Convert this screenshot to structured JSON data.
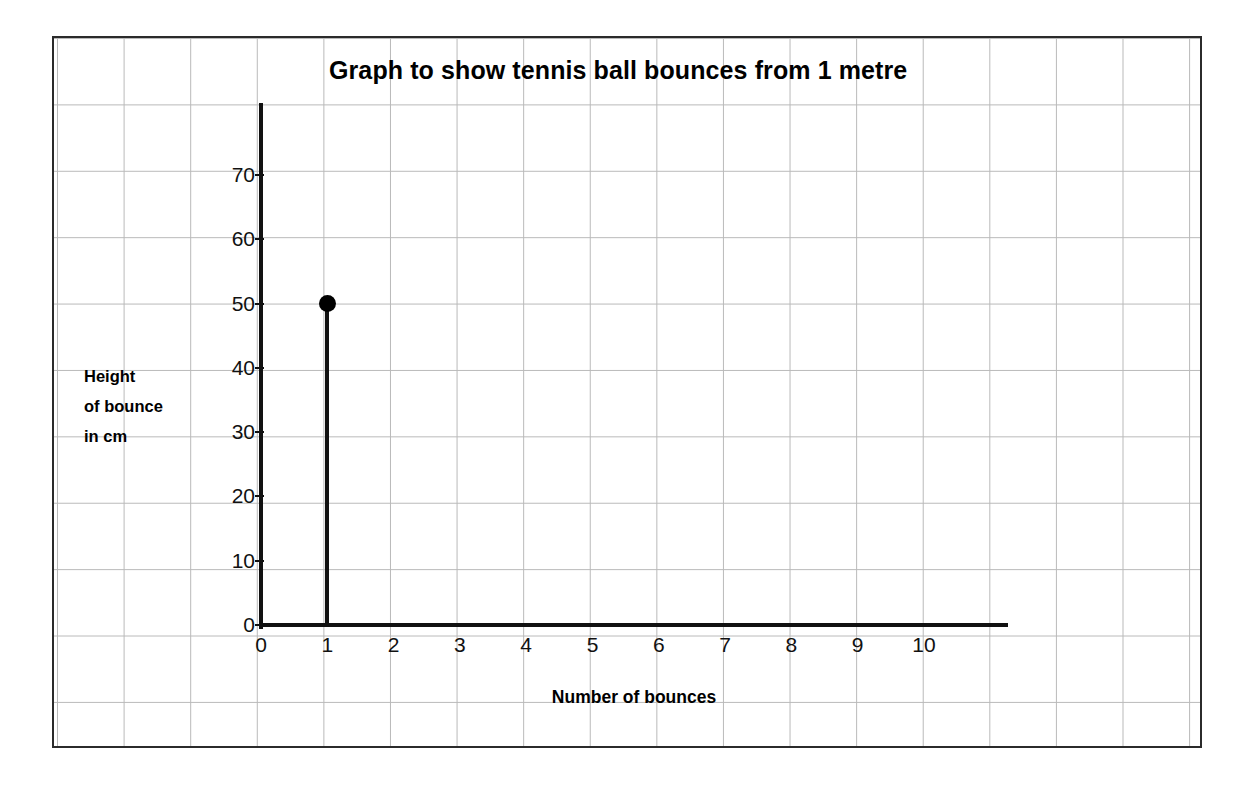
{
  "chart_data": {
    "type": "scatter",
    "title": "Graph to show tennis ball bounces from 1 metre",
    "xlabel": "Number of bounces",
    "ylabel": "Height of bounce in cm",
    "ylabel_lines": [
      "Height",
      "of bounce",
      "in cm"
    ],
    "x": [
      1
    ],
    "values": [
      50
    ],
    "points": [
      {
        "x": 1,
        "y": 50
      }
    ],
    "xticks": [
      0,
      1,
      2,
      3,
      4,
      5,
      6,
      7,
      8,
      9,
      10
    ],
    "yticks": [
      0,
      10,
      20,
      30,
      40,
      50,
      60,
      70
    ],
    "xlim": [
      0,
      11.3
    ],
    "ylim": [
      0,
      78
    ],
    "grid": true,
    "grid_style": "squared-paper-background",
    "legend": null,
    "marker": "filled-circle-with-stem-to-axis",
    "colors": {
      "axis": "#111111",
      "marker": "#000000",
      "grid": "#b9b9b9",
      "frame": "#2b2b2b",
      "background": "#ffffff"
    }
  }
}
